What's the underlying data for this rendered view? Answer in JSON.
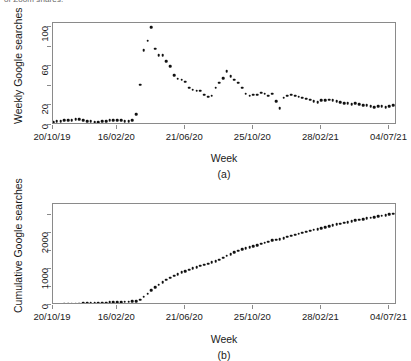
{
  "figure": {
    "top_caption": "of Zoom shares.",
    "panels": [
      {
        "id": "a",
        "caption": "(a)",
        "ylabel": "Weekly Google searches",
        "xlabel": "Week"
      },
      {
        "id": "b",
        "caption": "(b)",
        "ylabel": "Cumulative Google searches",
        "xlabel": "Week"
      }
    ]
  },
  "chart_data": [
    {
      "type": "scatter",
      "panel": "a",
      "title": "",
      "xlabel": "Week",
      "ylabel": "Weekly Google searches",
      "legend": null,
      "grid": false,
      "xlim": [
        0,
        91
      ],
      "ylim": [
        0,
        104
      ],
      "yticks": [
        0,
        20,
        40,
        60,
        80,
        100
      ],
      "ytick_labels": [
        "0",
        "",
        "20",
        "",
        "60",
        "",
        "100"
      ],
      "ytick_labels_shown": {
        "0": "0",
        "20": "20",
        "60": "60",
        "100": "100"
      },
      "xtick_indices": [
        0,
        17,
        35,
        53,
        71,
        89
      ],
      "xtick_labels": [
        "20/10/19",
        "16/02/20",
        "21/06/20",
        "25/10/20",
        "28/02/21",
        "04/07/21"
      ],
      "x": [
        0,
        1,
        2,
        3,
        4,
        5,
        6,
        7,
        8,
        9,
        10,
        11,
        12,
        13,
        14,
        15,
        16,
        17,
        18,
        19,
        20,
        21,
        22,
        23,
        24,
        25,
        26,
        27,
        28,
        29,
        30,
        31,
        32,
        33,
        34,
        35,
        36,
        37,
        38,
        39,
        40,
        41,
        42,
        43,
        44,
        45,
        46,
        47,
        48,
        49,
        50,
        51,
        52,
        53,
        54,
        55,
        56,
        57,
        58,
        59,
        60,
        61,
        62,
        63,
        64,
        65,
        66,
        67,
        68,
        69,
        70,
        71,
        72,
        73,
        74,
        75,
        76,
        77,
        78,
        79,
        80,
        81,
        82,
        83,
        84,
        85,
        86,
        87,
        88,
        89,
        90
      ],
      "values": [
        3,
        4,
        4,
        5,
        5,
        5,
        6,
        6,
        5,
        4,
        4,
        3,
        3,
        4,
        4,
        5,
        5,
        5,
        5,
        4,
        4,
        5,
        11,
        41,
        76,
        86,
        100,
        78,
        71,
        71,
        65,
        60,
        51,
        47,
        46,
        44,
        38,
        36,
        35,
        35,
        31,
        29,
        30,
        38,
        43,
        48,
        55,
        50,
        46,
        43,
        38,
        32,
        30,
        31,
        31,
        33,
        32,
        30,
        32,
        24,
        17,
        28,
        30,
        31,
        30,
        29,
        28,
        27,
        26,
        24,
        23,
        25,
        25,
        26,
        25,
        24,
        23,
        22,
        22,
        21,
        22,
        21,
        20,
        20,
        19,
        18,
        19,
        19,
        18,
        19,
        20
      ]
    },
    {
      "type": "scatter",
      "panel": "b",
      "title": "",
      "xlabel": "Week",
      "ylabel": "Cumulative Google searches",
      "legend": null,
      "grid": false,
      "xlim": [
        0,
        91
      ],
      "ylim": [
        0,
        2800
      ],
      "yticks": [
        0,
        500,
        1000,
        1500,
        2000,
        2500
      ],
      "ytick_labels_shown": {
        "0": "0",
        "1000": "1000",
        "2000": "2000"
      },
      "xtick_indices": [
        0,
        17,
        35,
        53,
        71,
        89
      ],
      "xtick_labels": [
        "20/10/19",
        "16/02/20",
        "21/06/20",
        "25/10/20",
        "28/02/21",
        "04/07/21"
      ],
      "x": [
        0,
        1,
        2,
        3,
        4,
        5,
        6,
        7,
        8,
        9,
        10,
        11,
        12,
        13,
        14,
        15,
        16,
        17,
        18,
        19,
        20,
        21,
        22,
        23,
        24,
        25,
        26,
        27,
        28,
        29,
        30,
        31,
        32,
        33,
        34,
        35,
        36,
        37,
        38,
        39,
        40,
        41,
        42,
        43,
        44,
        45,
        46,
        47,
        48,
        49,
        50,
        51,
        52,
        53,
        54,
        55,
        56,
        57,
        58,
        59,
        60,
        61,
        62,
        63,
        64,
        65,
        66,
        67,
        68,
        69,
        70,
        71,
        72,
        73,
        74,
        75,
        76,
        77,
        78,
        79,
        80,
        81,
        82,
        83,
        84,
        85,
        86,
        87,
        88,
        89,
        90
      ],
      "values": [
        3,
        7,
        11,
        16,
        21,
        26,
        32,
        38,
        43,
        47,
        51,
        54,
        57,
        61,
        65,
        70,
        75,
        80,
        85,
        89,
        93,
        98,
        109,
        150,
        226,
        312,
        412,
        490,
        561,
        632,
        697,
        757,
        808,
        855,
        901,
        945,
        983,
        1019,
        1054,
        1089,
        1120,
        1149,
        1179,
        1217,
        1260,
        1308,
        1363,
        1413,
        1459,
        1502,
        1540,
        1572,
        1602,
        1633,
        1664,
        1697,
        1729,
        1759,
        1791,
        1815,
        1832,
        1860,
        1890,
        1921,
        1951,
        1980,
        2008,
        2035,
        2061,
        2085,
        2108,
        2133,
        2158,
        2184,
        2209,
        2233,
        2256,
        2278,
        2300,
        2321,
        2343,
        2364,
        2384,
        2404,
        2423,
        2441,
        2459,
        2478,
        2497,
        2515,
        2534,
        2554
      ]
    }
  ]
}
